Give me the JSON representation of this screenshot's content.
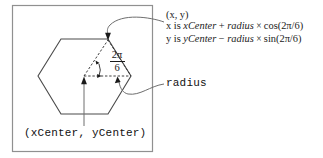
{
  "figure": {
    "background": "#ffffff",
    "border_color": "#8c8c8c",
    "ink_color": "#1a1a1a"
  },
  "annotations": {
    "point_label": "(x, y)",
    "formula_x_prefix": "x is ",
    "formula_x_center": "xCenter",
    "formula_x_op": " + ",
    "formula_x_radius": "radius",
    "formula_x_times": " × ",
    "formula_x_trig": "cos(2π/6)",
    "formula_y_prefix": "y is ",
    "formula_y_center": "yCenter",
    "formula_y_op": " − ",
    "formula_y_radius": "radius",
    "formula_y_times": " × ",
    "formula_y_trig": "sin(2π/6)",
    "radius_label": "radius",
    "center_label": "(xCenter, yCenter)",
    "angle_numerator": "2π",
    "angle_denominator": "6"
  },
  "geometry": {
    "box": {
      "x": 12,
      "y": 5,
      "width": 140,
      "height": 147
    },
    "hexagon_center": {
      "x": 84,
      "y": 76
    },
    "hexagon_radius": 44,
    "hexagon_points": "84,32 122,54 122,98 84,120 46,98 46,54",
    "top_vertex": {
      "x": 108,
      "y": 39
    },
    "right_vertex": {
      "x": 128,
      "y": 76
    }
  }
}
